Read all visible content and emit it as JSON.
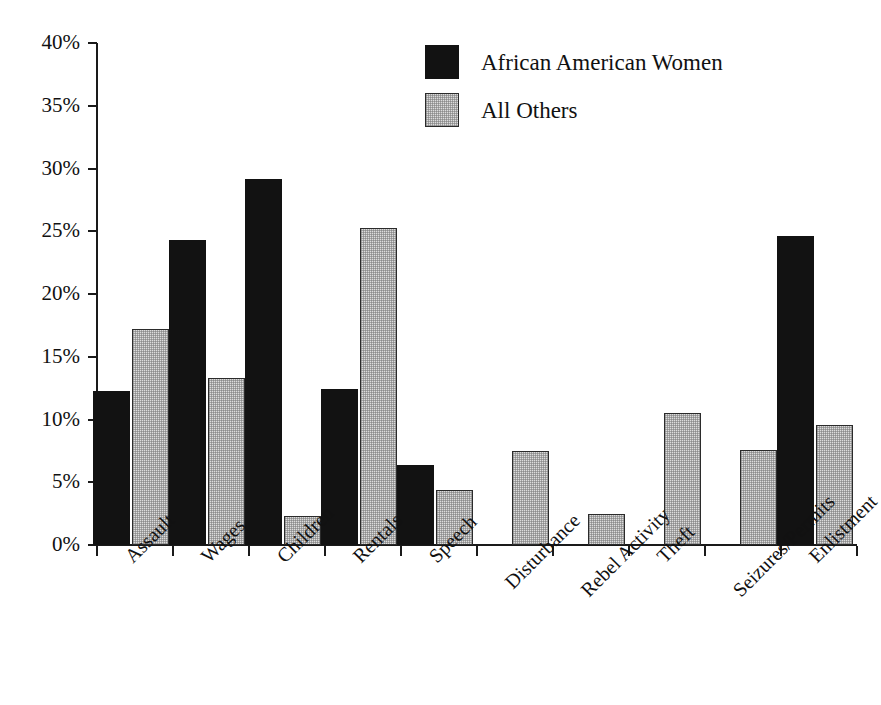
{
  "chart_data": {
    "type": "bar",
    "title": "",
    "subtitle": "",
    "xlabel": "",
    "ylabel": "",
    "ylim": [
      0,
      40
    ],
    "y_tick_labels": [
      "0%",
      "5%",
      "10%",
      "15%",
      "20%",
      "25%",
      "30%",
      "35%",
      "40%"
    ],
    "y_tick_values": [
      0,
      5,
      10,
      15,
      20,
      25,
      30,
      35,
      40
    ],
    "grid": false,
    "legend_position": "top-center",
    "categories": [
      "Assault",
      "Wages",
      "Children",
      "Rentals",
      "Speech",
      "Disturbance",
      "Rebel Activity",
      "Theft",
      "Seizures/Permits",
      "Enlistment"
    ],
    "series": [
      {
        "name": "African American Women",
        "color": "#121212",
        "values": [
          12.3,
          24.3,
          29.2,
          12.4,
          6.4,
          0,
          0,
          0,
          0,
          24.6
        ]
      },
      {
        "name": "All Others",
        "color": "#dcdcdc",
        "values": [
          17.2,
          13.3,
          2.3,
          25.3,
          4.4,
          7.5,
          2.5,
          10.5,
          7.6,
          9.6
        ]
      }
    ]
  },
  "legend": {
    "items": [
      {
        "label": "African American Women",
        "swatch": "dark"
      },
      {
        "label": "All Others",
        "swatch": "light"
      }
    ]
  },
  "colors": {
    "background": "#ffffff",
    "axis": "#1a1a1a",
    "series_dark": "#121212",
    "series_light": "#dcdcdc",
    "text": "#111111"
  }
}
